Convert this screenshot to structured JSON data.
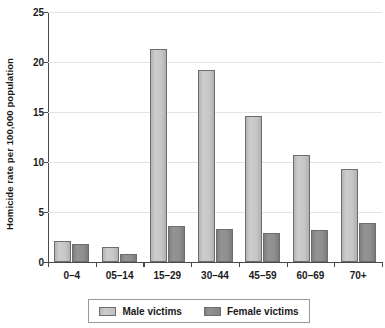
{
  "chart_data": {
    "type": "bar",
    "title": "",
    "xlabel": "",
    "ylabel": "Homicide rate per 100,000 population",
    "categories": [
      "0–4",
      "05–14",
      "15–29",
      "30–44",
      "45–59",
      "60–69",
      "70+"
    ],
    "series": [
      {
        "name": "Male victims",
        "color": "#c6c6c6",
        "values": [
          2.1,
          1.5,
          21.3,
          19.2,
          14.6,
          10.7,
          9.3
        ]
      },
      {
        "name": "Female victims",
        "color": "#8c8c8c",
        "values": [
          1.8,
          0.8,
          3.6,
          3.3,
          2.9,
          3.2,
          3.9
        ]
      }
    ],
    "ylim": [
      0,
      25
    ],
    "yticks": [
      0,
      5,
      10,
      15,
      20,
      25
    ],
    "ytick_labels": [
      "0",
      "5",
      "10",
      "15",
      "20",
      "25"
    ],
    "grid": true,
    "legend_position": "bottom"
  },
  "legend": {
    "entries": [
      {
        "label": "Male victims"
      },
      {
        "label": "Female victims"
      }
    ]
  }
}
